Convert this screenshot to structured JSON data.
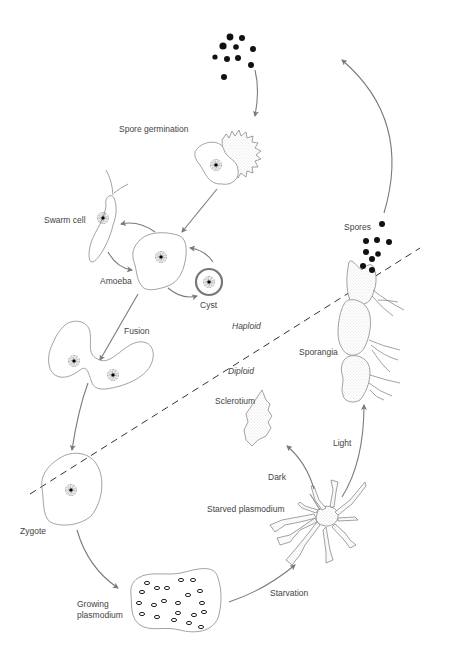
{
  "diagram": {
    "zones": {
      "haploid": {
        "label": "Haploid",
        "x": 228,
        "y": 329
      },
      "diploid": {
        "label": "Diploid",
        "x": 228,
        "y": 374
      }
    },
    "stages": [
      {
        "id": "spore-germination",
        "label": "Spore germination",
        "x": 119,
        "y": 132
      },
      {
        "id": "swarm-cell",
        "label": "Swarm cell",
        "x": 44,
        "y": 223
      },
      {
        "id": "amoeba",
        "label": "Amoeba",
        "x": 100,
        "y": 284
      },
      {
        "id": "cyst",
        "label": "Cyst",
        "x": 200,
        "y": 308
      },
      {
        "id": "fusion",
        "label": "Fusion",
        "x": 124,
        "y": 334
      },
      {
        "id": "sclerotium",
        "label": "Sclerotium",
        "x": 215,
        "y": 404
      },
      {
        "id": "sporangia",
        "label": "Sporangia",
        "x": 299,
        "y": 355
      },
      {
        "id": "spores",
        "label": "Spores",
        "x": 344,
        "y": 230
      },
      {
        "id": "light",
        "label": "Light",
        "x": 333,
        "y": 446
      },
      {
        "id": "dark",
        "label": "Dark",
        "x": 268,
        "y": 480
      },
      {
        "id": "starved-plasmodium",
        "label": "Starved plasmodium",
        "x": 207,
        "y": 512
      },
      {
        "id": "zygote",
        "label": "Zygote",
        "x": 20,
        "y": 534
      },
      {
        "id": "starvation",
        "label": "Starvation",
        "x": 270,
        "y": 596
      },
      {
        "id": "growing-plasmodium-1",
        "label": "Growing",
        "x": 77,
        "y": 607
      },
      {
        "id": "growing-plasmodium-2",
        "label": "plasmodium",
        "x": 77,
        "y": 618
      }
    ],
    "colors": {
      "background": "#ffffff",
      "outline": "#8a8a8a",
      "arrow": "#7a7a7a",
      "text": "#444444",
      "spore": "#111111"
    }
  }
}
